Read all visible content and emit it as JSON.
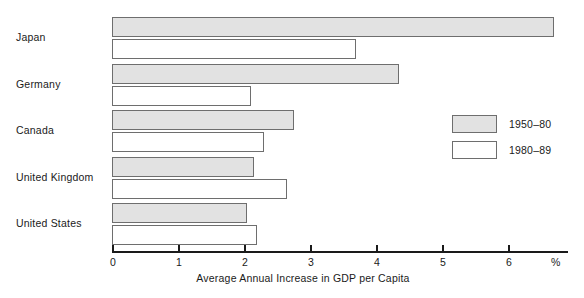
{
  "chart_data": {
    "type": "bar",
    "orientation": "horizontal",
    "title": "",
    "xlabel": "Average Annual Increase in GDP per Capita",
    "ylabel": "",
    "unit": "%",
    "xlim": [
      0,
      6.9
    ],
    "xticks": [
      0,
      1,
      2,
      3,
      4,
      5,
      6
    ],
    "xticklabels": [
      "0",
      "1",
      "2",
      "3",
      "4",
      "5",
      "6"
    ],
    "grid": false,
    "legend_position": "center-right",
    "categories": [
      "Japan",
      "Germany",
      "Canada",
      "United Kingdom",
      "United States"
    ],
    "series": [
      {
        "name": "1950–80",
        "values": [
          6.7,
          4.35,
          2.75,
          2.15,
          2.05
        ]
      },
      {
        "name": "1980–89",
        "values": [
          3.7,
          2.1,
          2.3,
          2.65,
          2.2
        ]
      }
    ]
  },
  "legend": {
    "items": [
      {
        "label": "1950–80"
      },
      {
        "label": "1980–89"
      }
    ]
  }
}
